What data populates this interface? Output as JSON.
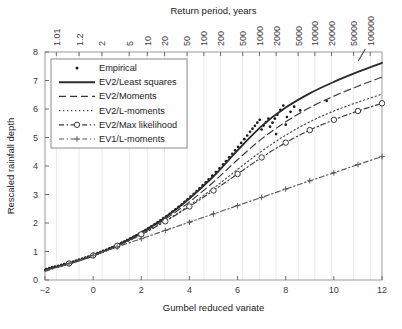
{
  "chart_data": {
    "type": "line",
    "title": "",
    "xlabel": "Gumbel reduced variate",
    "ylabel": "Rescaled rainfall depth",
    "top_axis_label": "Return period, years",
    "xlim": [
      -2,
      12
    ],
    "ylim": [
      0,
      8
    ],
    "xticks": [
      -2,
      0,
      2,
      4,
      6,
      8,
      10,
      12
    ],
    "xtick_labels": [
      "−2",
      "0",
      "2",
      "4",
      "6",
      "8",
      "10",
      "12"
    ],
    "yticks": [
      0,
      1,
      2,
      3,
      4,
      5,
      6,
      7,
      8
    ],
    "ytick_labels": [
      "0",
      "1",
      "2",
      "3",
      "4",
      "5",
      "6",
      "7",
      "8"
    ],
    "top_ticks_return_period": [
      1.01,
      1.2,
      2,
      5,
      10,
      20,
      50,
      100,
      200,
      500,
      1000,
      2000,
      5000,
      10000,
      20000,
      50000,
      100000
    ],
    "top_tick_labels": [
      "1.01",
      "1.2",
      "2",
      "5",
      "10",
      "20",
      "50",
      "100",
      "200",
      "500",
      "1000",
      "2000",
      "5000",
      "10000",
      "20000",
      "50000",
      "100000"
    ],
    "grid": "vertical-faint",
    "legend_position": "upper-left-inside",
    "series": [
      {
        "name": "Empirical",
        "style": "points",
        "marker": "dot",
        "color": "#1a1a1a",
        "points": [
          [
            -1.95,
            0.38
          ],
          [
            -1.82,
            0.42
          ],
          [
            -1.7,
            0.45
          ],
          [
            -1.58,
            0.47
          ],
          [
            -1.45,
            0.5
          ],
          [
            -1.32,
            0.53
          ],
          [
            -1.2,
            0.56
          ],
          [
            -1.08,
            0.59
          ],
          [
            -0.95,
            0.62
          ],
          [
            -0.82,
            0.65
          ],
          [
            -0.7,
            0.68
          ],
          [
            -0.58,
            0.72
          ],
          [
            -0.45,
            0.75
          ],
          [
            -0.32,
            0.79
          ],
          [
            -0.2,
            0.82
          ],
          [
            -0.08,
            0.86
          ],
          [
            0.05,
            0.9
          ],
          [
            0.18,
            0.94
          ],
          [
            0.3,
            0.98
          ],
          [
            0.42,
            1.02
          ],
          [
            0.55,
            1.06
          ],
          [
            0.68,
            1.11
          ],
          [
            0.8,
            1.15
          ],
          [
            0.92,
            1.2
          ],
          [
            1.05,
            1.25
          ],
          [
            1.18,
            1.3
          ],
          [
            1.3,
            1.35
          ],
          [
            1.42,
            1.4
          ],
          [
            1.55,
            1.46
          ],
          [
            1.68,
            1.51
          ],
          [
            1.8,
            1.57
          ],
          [
            1.92,
            1.63
          ],
          [
            2.05,
            1.69
          ],
          [
            2.18,
            1.75
          ],
          [
            2.3,
            1.82
          ],
          [
            2.42,
            1.88
          ],
          [
            2.55,
            1.95
          ],
          [
            2.68,
            2.02
          ],
          [
            2.8,
            2.09
          ],
          [
            2.92,
            2.17
          ],
          [
            3.05,
            2.24
          ],
          [
            3.18,
            2.32
          ],
          [
            3.3,
            2.4
          ],
          [
            3.42,
            2.48
          ],
          [
            3.55,
            2.57
          ],
          [
            3.68,
            2.65
          ],
          [
            3.8,
            2.74
          ],
          [
            3.92,
            2.83
          ],
          [
            4.05,
            2.93
          ],
          [
            4.18,
            3.02
          ],
          [
            4.3,
            3.12
          ],
          [
            4.42,
            3.22
          ],
          [
            4.55,
            3.32
          ],
          [
            4.68,
            3.43
          ],
          [
            4.8,
            3.53
          ],
          [
            4.95,
            3.66
          ],
          [
            5.1,
            3.79
          ],
          [
            5.25,
            3.92
          ],
          [
            5.4,
            4.06
          ],
          [
            5.52,
            4.17
          ],
          [
            5.65,
            4.3
          ],
          [
            5.78,
            4.43
          ],
          [
            5.9,
            4.55
          ],
          [
            6.02,
            4.67
          ],
          [
            6.15,
            4.81
          ],
          [
            6.28,
            4.94
          ],
          [
            6.4,
            5.07
          ],
          [
            6.52,
            5.2
          ],
          [
            6.62,
            5.31
          ],
          [
            6.72,
            5.41
          ],
          [
            6.82,
            5.52
          ],
          [
            6.92,
            5.62
          ],
          [
            7.0,
            5.28
          ],
          [
            7.08,
            5.42
          ],
          [
            7.18,
            5.54
          ],
          [
            7.28,
            5.66
          ],
          [
            7.35,
            5.38
          ],
          [
            7.45,
            5.52
          ],
          [
            7.55,
            5.66
          ],
          [
            7.65,
            5.8
          ],
          [
            7.78,
            5.97
          ],
          [
            7.9,
            6.12
          ],
          [
            8.05,
            5.72
          ],
          [
            8.2,
            5.9
          ],
          [
            8.35,
            6.08
          ],
          [
            7.6,
            5.12
          ],
          [
            8.0,
            5.45
          ],
          [
            8.6,
            5.95
          ],
          [
            9.7,
            6.28
          ]
        ]
      },
      {
        "name": "EV2/Least squares",
        "style": "solid",
        "color": "#2b2b2b",
        "points": [
          [
            -2,
            0.36
          ],
          [
            -1,
            0.58
          ],
          [
            0,
            0.86
          ],
          [
            1,
            1.22
          ],
          [
            2,
            1.66
          ],
          [
            3,
            2.2
          ],
          [
            4,
            2.86
          ],
          [
            5,
            3.64
          ],
          [
            6,
            4.55
          ],
          [
            7,
            5.4
          ],
          [
            8,
            6.05
          ],
          [
            9,
            6.55
          ],
          [
            10,
            6.95
          ],
          [
            11,
            7.3
          ],
          [
            12,
            7.62
          ]
        ]
      },
      {
        "name": "EV2/Moments",
        "style": "dashed",
        "color": "#3a3a3a",
        "points": [
          [
            -2,
            0.35
          ],
          [
            -1,
            0.57
          ],
          [
            0,
            0.85
          ],
          [
            1,
            1.2
          ],
          [
            2,
            1.63
          ],
          [
            3,
            2.14
          ],
          [
            4,
            2.74
          ],
          [
            5,
            3.44
          ],
          [
            6,
            4.22
          ],
          [
            7,
            4.95
          ],
          [
            8,
            5.55
          ],
          [
            9,
            6.05
          ],
          [
            10,
            6.45
          ],
          [
            11,
            6.8
          ],
          [
            12,
            7.12
          ]
        ]
      },
      {
        "name": "EV2/L-moments",
        "style": "dotted",
        "color": "#4a4a4a",
        "points": [
          [
            -2,
            0.34
          ],
          [
            -1,
            0.56
          ],
          [
            0,
            0.84
          ],
          [
            1,
            1.18
          ],
          [
            2,
            1.59
          ],
          [
            3,
            2.07
          ],
          [
            4,
            2.62
          ],
          [
            5,
            3.22
          ],
          [
            6,
            3.88
          ],
          [
            7,
            4.52
          ],
          [
            8,
            5.08
          ],
          [
            9,
            5.55
          ],
          [
            10,
            5.93
          ],
          [
            11,
            6.24
          ],
          [
            12,
            6.52
          ]
        ]
      },
      {
        "name": "EV2/Max likelihood",
        "style": "dashdot-circle",
        "color": "#3a3a3a",
        "points": [
          [
            -2,
            0.36
          ],
          [
            -1,
            0.58
          ],
          [
            0,
            0.86
          ],
          [
            1,
            1.2
          ],
          [
            2,
            1.6
          ],
          [
            3,
            2.06
          ],
          [
            4,
            2.58
          ],
          [
            5,
            3.14
          ],
          [
            6,
            3.72
          ],
          [
            7,
            4.3
          ],
          [
            8,
            4.82
          ],
          [
            9,
            5.26
          ],
          [
            10,
            5.62
          ],
          [
            11,
            5.93
          ],
          [
            12,
            6.2
          ]
        ]
      },
      {
        "name": "EV1/L-moments",
        "style": "dashdot-plus",
        "color": "#5a5a5a",
        "points": [
          [
            -2,
            0.3
          ],
          [
            -1,
            0.58
          ],
          [
            0,
            0.87
          ],
          [
            1,
            1.16
          ],
          [
            2,
            1.45
          ],
          [
            3,
            1.74
          ],
          [
            4,
            2.03
          ],
          [
            5,
            2.32
          ],
          [
            6,
            2.61
          ],
          [
            7,
            2.9
          ],
          [
            8,
            3.19
          ],
          [
            9,
            3.48
          ],
          [
            10,
            3.76
          ],
          [
            11,
            4.05
          ],
          [
            12,
            4.33
          ]
        ]
      }
    ]
  },
  "legend": {
    "items": [
      {
        "label": "Empirical"
      },
      {
        "label": "EV2/Least squares"
      },
      {
        "label": "EV2/Moments"
      },
      {
        "label": "EV2/L-moments"
      },
      {
        "label": "EV2/Max likelihood"
      },
      {
        "label": "EV1/L-moments"
      }
    ]
  }
}
